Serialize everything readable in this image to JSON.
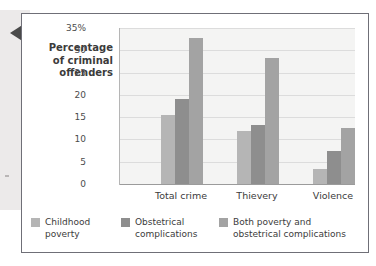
{
  "chart_data": {
    "type": "bar",
    "title": "",
    "subtitle": "",
    "xlabel": "",
    "ylabel": "Percentage of criminal offenders",
    "ylabel_lines": [
      "Percentage",
      "of criminal",
      "offenders"
    ],
    "categories": [
      "Total crime",
      "Thievery",
      "Violence"
    ],
    "series": [
      {
        "name": "Childhood poverty",
        "name_lines": [
          "Childhood",
          "poverty"
        ],
        "color": "#b5b5b5",
        "values": [
          15.5,
          12.0,
          3.4
        ]
      },
      {
        "name": "Obstetrical complications",
        "name_lines": [
          "Obstetrical",
          "complications"
        ],
        "color": "#8e8e8e",
        "values": [
          19.0,
          13.2,
          7.3
        ]
      },
      {
        "name": "Both poverty and obstetrical complications",
        "name_lines": [
          "Both poverty and",
          "obstetrical complications"
        ],
        "color": "#a3a3a3",
        "values": [
          32.8,
          28.2,
          12.5
        ]
      }
    ],
    "ylim": [
      0,
      35
    ],
    "ytick_values": [
      0,
      5,
      10,
      15,
      20,
      25,
      30,
      35
    ],
    "ytick_labels": [
      "0",
      "5",
      "10",
      "15",
      "20",
      "25",
      "30",
      "35%"
    ],
    "grid": true,
    "legend_position": "bottom"
  },
  "decoration": {
    "pointer_icon": "left-pointing-triangle-icon",
    "page_strip_color": "#eceaea",
    "frame_color": "#6f6f77",
    "plot_background": "#f4f4f3"
  }
}
